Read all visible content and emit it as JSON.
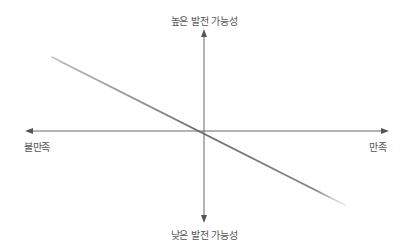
{
  "diagram": {
    "type": "quadrant",
    "axes": {
      "y_top_label": "높은 발전 가능성",
      "y_bottom_label": "낮은 발전 가능성",
      "x_left_label": "불만족",
      "x_right_label": "만족"
    },
    "colors": {
      "axis": "#666666",
      "trend_line": "#777777",
      "label_text": "#555555"
    },
    "trend_line": {
      "direction": "descending",
      "from": "top-left",
      "to": "bottom-right",
      "passes_through_origin": true
    }
  }
}
